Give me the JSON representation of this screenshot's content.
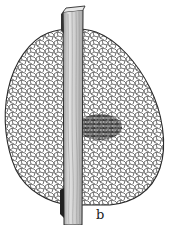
{
  "figure": {
    "label": "b",
    "colors": {
      "ink": "#2a2a2a",
      "background": "#ffffff",
      "stake_shade": "#c8c8c8",
      "dark_patch": "#333333"
    }
  }
}
